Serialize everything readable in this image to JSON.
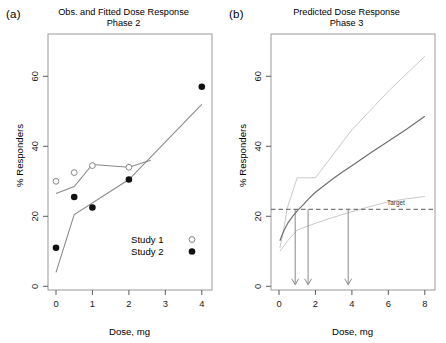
{
  "figure": {
    "width": 446,
    "height": 343,
    "background": "#ffffff"
  },
  "panels": [
    {
      "key": "a",
      "label": "(a)",
      "title": "Obs. and Fitted Dose Response\nPhase 2",
      "xlabel": "Dose, mg",
      "ylabel": "% Responders"
    },
    {
      "key": "b",
      "label": "(b)",
      "title": "Predicted Dose Response\nPhase 3",
      "xlabel": "Dose, mg",
      "ylabel": "% Responders"
    }
  ],
  "chart_data": [
    {
      "type": "scatter",
      "panel": "a",
      "title": "Obs. and Fitted Dose Response Phase 2",
      "xlabel": "Dose, mg",
      "ylabel": "% Responders",
      "xlim": [
        -0.22,
        4.3
      ],
      "ylim": [
        -4,
        70
      ],
      "xticks": [
        0,
        1,
        2,
        3,
        4
      ],
      "xticklabels": [
        "0",
        "1",
        "2",
        "3",
        "4"
      ],
      "yticks": [
        0,
        20,
        40,
        60
      ],
      "yticklabels": [
        "0",
        "20",
        "40",
        "60"
      ],
      "grid": false,
      "legend": {
        "position": "inside-lower-right",
        "entries": [
          {
            "label": "Study 1",
            "marker": "open-circle"
          },
          {
            "label": "Study 2",
            "marker": "filled-circle"
          }
        ]
      },
      "series": [
        {
          "name": "Study 1",
          "marker": "open-circle",
          "type": "scatter",
          "x": [
            0,
            0.5,
            1,
            2
          ],
          "y": [
            30,
            32.5,
            34.5,
            34
          ]
        },
        {
          "name": "Study 2",
          "marker": "filled-circle",
          "type": "scatter",
          "x": [
            0,
            0.5,
            1,
            2,
            4
          ],
          "y": [
            11,
            25.5,
            22.5,
            30.5,
            57
          ]
        },
        {
          "name": "Study 1 fitted",
          "type": "line",
          "x": [
            0,
            0.5,
            1,
            2,
            2.6
          ],
          "y": [
            26.5,
            28.5,
            34.8,
            34,
            36
          ]
        },
        {
          "name": "Study 2 fitted",
          "type": "line",
          "x": [
            0,
            0.5,
            2,
            4
          ],
          "y": [
            4,
            20.5,
            30.5,
            52
          ]
        }
      ]
    },
    {
      "type": "line",
      "panel": "b",
      "title": "Predicted Dose Response Phase 3",
      "xlabel": "Dose, mg",
      "ylabel": "% Responders",
      "xlim": [
        -0.42,
        8.6
      ],
      "ylim": [
        -4,
        70
      ],
      "xticks": [
        0,
        2,
        4,
        6,
        8
      ],
      "xticklabels": [
        "0",
        "2",
        "4",
        "6",
        "8"
      ],
      "yticks": [
        0,
        20,
        40,
        60
      ],
      "yticklabels": [
        "0",
        "20",
        "40",
        "60"
      ],
      "grid": false,
      "annotations": [
        {
          "text": "Target",
          "y": 22,
          "type": "hline-label"
        }
      ],
      "target_line": {
        "label": "Target",
        "y": 22,
        "style": "dashed"
      },
      "arrows": [
        {
          "x": 0.9,
          "from_y": 22,
          "to_y": 0
        },
        {
          "x": 1.6,
          "from_y": 22,
          "to_y": 0
        },
        {
          "x": 3.8,
          "from_y": 22,
          "to_y": 0
        }
      ],
      "series": [
        {
          "name": "Predicted mean",
          "type": "line",
          "style": "solid",
          "x": [
            0.1,
            0.5,
            1,
            1.6,
            2,
            3,
            4,
            5,
            6,
            7,
            8
          ],
          "y": [
            13,
            16.5,
            19.2,
            22,
            23.8,
            28,
            31.5,
            35,
            38.5,
            42.2,
            46
          ]
        },
        {
          "name": "Upper bound",
          "type": "line",
          "style": "solid-light",
          "x": [
            0.1,
            0.5,
            0.9,
            2,
            4,
            6,
            8
          ],
          "y": [
            11,
            16,
            22,
            31,
            45,
            56,
            66
          ]
        },
        {
          "name": "Lower bound",
          "type": "line",
          "style": "solid-light",
          "x": [
            0.1,
            1,
            2,
            3.8,
            5,
            6,
            8
          ],
          "y": [
            10,
            14.5,
            18,
            22,
            24,
            25.3,
            26.8
          ]
        }
      ]
    }
  ]
}
